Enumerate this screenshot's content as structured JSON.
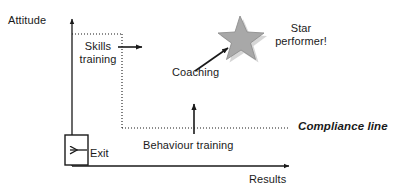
{
  "diagram": {
    "axes": {
      "y_label": "Attitude",
      "x_label": "Results"
    },
    "labels": {
      "skills_training": "Skills\ntraining",
      "coaching": "Coaching",
      "star_performer": "Star\nperformer!",
      "behaviour_training": "Behaviour training",
      "compliance_line": "Compliance line",
      "exit": "Exit"
    },
    "icons": {
      "star": "star-icon",
      "exit_arrow": "arrow-left-icon",
      "skills_arrow": "arrow-right-icon",
      "behaviour_arrow": "arrow-up-icon",
      "coaching_arrow": "arrow-diagonal-up-right-icon"
    },
    "colors": {
      "line": "#1a1a1a",
      "text": "#1a1a1a",
      "star_fill": "#a8a8a8",
      "star_stroke": "#8c8c8c",
      "star_shadow": "#c9c9c9",
      "background": "#ffffff"
    }
  }
}
